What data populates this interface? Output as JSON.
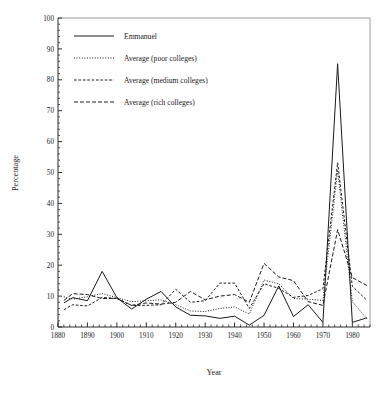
{
  "chart_data": {
    "type": "line",
    "title": "",
    "subtitle": "",
    "xlabel": "Year",
    "ylabel": "Percentage",
    "xlim": [
      1880,
      1986
    ],
    "ylim": [
      0,
      100
    ],
    "xticks": [
      1880,
      1890,
      1900,
      1910,
      1920,
      1930,
      1940,
      1950,
      1960,
      1970,
      1980
    ],
    "xtick_labels": [
      "1880",
      "1890",
      "1900",
      "1910",
      "1920",
      "1930",
      "1940",
      "1950",
      "1960",
      "1970",
      "1980"
    ],
    "x_minor_step": 2,
    "yticks": [
      0,
      10,
      20,
      30,
      40,
      50,
      60,
      70,
      80,
      90,
      100
    ],
    "ytick_labels": [
      "0",
      "10",
      "20",
      "30",
      "40",
      "50",
      "60",
      "70",
      "80",
      "90",
      "100"
    ],
    "y_minor_step": 2,
    "grid": false,
    "legend_position": "top-left",
    "x": [
      1882,
      1885,
      1890,
      1895,
      1900,
      1905,
      1910,
      1915,
      1920,
      1925,
      1930,
      1935,
      1940,
      1945,
      1950,
      1955,
      1960,
      1965,
      1970,
      1975,
      1980,
      1985
    ],
    "series": [
      {
        "name": "Emmanuel",
        "style": "solid",
        "dash": "none",
        "color": "#1a1a1a",
        "values": [
          7.8,
          9.5,
          8.5,
          18.0,
          9.5,
          5.8,
          9.0,
          11.5,
          6.5,
          3.8,
          3.6,
          2.8,
          3.5,
          0.6,
          3.8,
          13.3,
          3.4,
          7.2,
          1.5,
          85.2,
          1.5,
          3.0
        ]
      },
      {
        "name": "Average (poor colleges)",
        "style": "fine-dotted",
        "dash": "1,1.6",
        "color": "#1a1a1a",
        "values": [
          9.8,
          9.0,
          9.8,
          10.8,
          9.5,
          8.2,
          8.5,
          8.8,
          7.2,
          5.2,
          5.0,
          6.0,
          6.5,
          4.2,
          15.2,
          14.0,
          9.2,
          9.0,
          8.6,
          50.8,
          8.2,
          2.6
        ]
      },
      {
        "name": "Average (medium colleges)",
        "style": "dashed",
        "dash": "2.6,1.8",
        "color": "#1a1a1a",
        "values": [
          5.6,
          7.2,
          6.8,
          9.6,
          9.2,
          7.0,
          7.0,
          7.2,
          12.2,
          8.0,
          8.5,
          14.2,
          14.2,
          6.0,
          14.0,
          12.5,
          9.6,
          10.2,
          12.4,
          53.2,
          13.2,
          8.6
        ]
      },
      {
        "name": "Average (rich colleges)",
        "style": "long-dashed",
        "dash": "4,2",
        "color": "#1a1a1a",
        "values": [
          8.6,
          10.8,
          10.5,
          9.2,
          9.3,
          7.0,
          7.8,
          7.4,
          8.0,
          11.5,
          8.8,
          10.0,
          10.5,
          8.0,
          20.6,
          16.2,
          15.0,
          8.2,
          7.0,
          31.5,
          16.0,
          13.4
        ]
      }
    ]
  },
  "legend": {
    "entries": [
      {
        "label": "Emmanuel"
      },
      {
        "label": "Average (poor colleges)"
      },
      {
        "label": "Average (medium colleges)"
      },
      {
        "label": "Average (rich colleges)"
      }
    ]
  }
}
